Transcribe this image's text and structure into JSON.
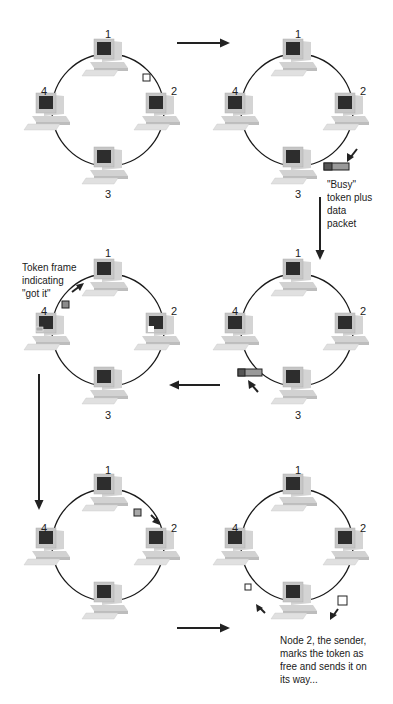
{
  "diagram": {
    "type": "token-ring-sequence",
    "panels": [
      {
        "id": 1,
        "center": [
          108,
          110
        ],
        "node_labels": [
          "1",
          "2",
          "3",
          "4"
        ],
        "tokens": [
          {
            "kind": "free",
            "position": "between-1-and-2"
          }
        ]
      },
      {
        "id": 2,
        "center": [
          297,
          110
        ],
        "node_labels": [
          "1",
          "2",
          "3",
          "4"
        ],
        "tokens": [
          {
            "kind": "busy-plus-data",
            "position": "between-2-and-3"
          }
        ],
        "caption": "\"Busy\"\ntoken plus\ndata\npacket"
      },
      {
        "id": 3,
        "center": [
          108,
          330
        ],
        "node_labels": [
          "1",
          "2",
          "3",
          "4"
        ],
        "tokens": [
          {
            "kind": "got-it",
            "position": "between-4-and-1"
          }
        ],
        "caption": "Token frame\nindicating\n\"got it\""
      },
      {
        "id": 4,
        "center": [
          297,
          330
        ],
        "node_labels": [
          "1",
          "2",
          "3",
          "4"
        ],
        "tokens": [
          {
            "kind": "busy-plus-data",
            "position": "between-3-and-4"
          }
        ]
      },
      {
        "id": 5,
        "center": [
          108,
          545
        ],
        "node_labels": [
          "1",
          "2",
          "4"
        ],
        "tokens": [
          {
            "kind": "got-it",
            "position": "between-1-and-2"
          }
        ]
      },
      {
        "id": 6,
        "center": [
          297,
          545
        ],
        "node_labels": [
          "1",
          "2",
          "4"
        ],
        "tokens": [
          {
            "kind": "free",
            "position": "between-3-and-4"
          },
          {
            "kind": "free",
            "position": "between-2-and-3"
          }
        ],
        "caption": "Node 2, the sender,\nmarks the token as\nfree and sends it on\nits way..."
      }
    ],
    "flow_arrows": [
      "panel1->panel2",
      "panel2->panel4",
      "panel4->panel3",
      "panel3->panel5",
      "panel5->panel6"
    ],
    "colors": {
      "ring": "#1a1a1a",
      "monitor_body": "#c8c8c8",
      "screen": "#2e2e2e",
      "token_free": "#ffffff",
      "token_busy": "#9a9a9a",
      "arrow": "#222222"
    }
  },
  "labels": {
    "p1": {
      "n1": "1",
      "n2": "2",
      "n3": "3",
      "n4": "4"
    },
    "p2": {
      "n1": "1",
      "n2": "2",
      "n3": "3",
      "n4": "4",
      "caption": [
        "\"Busy\"",
        "token plus",
        "data",
        "packet"
      ]
    },
    "p3": {
      "n1": "1",
      "n2": "2",
      "n3": "3",
      "n4": "4",
      "caption": [
        "Token frame",
        "indicating",
        "\"got it\""
      ]
    },
    "p4": {
      "n1": "1",
      "n2": "2",
      "n3": "3",
      "n4": "4"
    },
    "p5": {
      "n1": "1",
      "n2": "2",
      "n4": "4"
    },
    "p6": {
      "n1": "1",
      "n2": "2",
      "n4": "4",
      "caption": [
        "Node 2, the sender,",
        "marks the token as",
        "free and sends it on",
        "its way..."
      ]
    }
  }
}
